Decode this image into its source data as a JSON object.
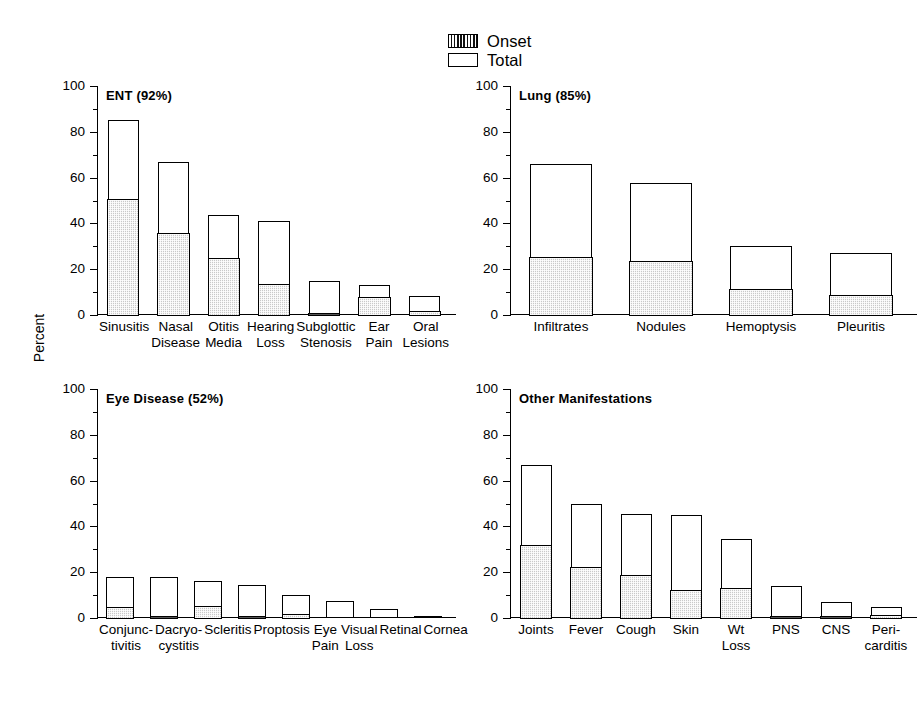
{
  "legend": {
    "items": [
      {
        "label": "Onset",
        "swatch": "hatched-dark-swatch"
      },
      {
        "label": "Total",
        "swatch": "open-white-swatch"
      }
    ]
  },
  "axis": {
    "ylabel": "Percent",
    "ticks": [
      "0",
      "20",
      "40",
      "60",
      "80",
      "100"
    ]
  },
  "colors": {
    "onset_fill": "#c9c9c9",
    "total_fill": "#ffffff",
    "outline": "#000000",
    "background": "#ffffff"
  },
  "chart_data": [
    {
      "type": "bar",
      "title": "ENT (92%)",
      "xlabel": "",
      "ylabel": "Percent",
      "ylim": [
        0,
        100
      ],
      "yticks": [
        0,
        20,
        40,
        60,
        80,
        100
      ],
      "grid": false,
      "legend_position": "top-center",
      "categories": [
        "Sinusitis",
        "Nasal\nDisease",
        "Otitis\nMedia",
        "Hearing\nLoss",
        "Subglottic\nStenosis",
        "Ear\nPain",
        "Oral\nLesions"
      ],
      "series": [
        {
          "name": "Onset",
          "values": [
            51,
            36,
            25,
            14,
            0.5,
            8,
            2
          ]
        },
        {
          "name": "Total",
          "values": [
            85,
            67,
            43.5,
            41,
            15,
            13,
            8.5
          ]
        }
      ]
    },
    {
      "type": "bar",
      "title": "Lung (85%)",
      "xlabel": "",
      "ylabel": "Percent",
      "ylim": [
        0,
        100
      ],
      "yticks": [
        0,
        20,
        40,
        60,
        80,
        100
      ],
      "grid": false,
      "categories": [
        "Infiltrates",
        "Nodules",
        "Hemoptysis",
        "Pleuritis"
      ],
      "series": [
        {
          "name": "Onset",
          "values": [
            25.5,
            24,
            11.5,
            9
          ]
        },
        {
          "name": "Total",
          "values": [
            66,
            57.5,
            30,
            27
          ]
        }
      ]
    },
    {
      "type": "bar",
      "title": "Eye Disease (52%)",
      "xlabel": "",
      "ylabel": "Percent",
      "ylim": [
        0,
        100
      ],
      "yticks": [
        0,
        20,
        40,
        60,
        80,
        100
      ],
      "grid": false,
      "categories": [
        "Conjunc-\ntivitis",
        "Dacryo-\ncystitis",
        "Scleritis",
        "Proptosis",
        "Eye\nPain",
        "Visual\nLoss",
        "Retinal",
        "Cornea"
      ],
      "series": [
        {
          "name": "Onset",
          "values": [
            5,
            0.7,
            5.5,
            1.2,
            2.2,
            0,
            0,
            0
          ]
        },
        {
          "name": "Total",
          "values": [
            18,
            17.8,
            16,
            14.5,
            10,
            7.5,
            4,
            1
          ]
        }
      ]
    },
    {
      "type": "bar",
      "title": "Other Manifestations",
      "xlabel": "",
      "ylabel": "Percent",
      "ylim": [
        0,
        100
      ],
      "yticks": [
        0,
        20,
        40,
        60,
        80,
        100
      ],
      "grid": false,
      "categories": [
        "Joints",
        "Fever",
        "Cough",
        "Skin",
        "Wt Loss",
        "PNS",
        "CNS",
        "Peri-\ncarditis"
      ],
      "series": [
        {
          "name": "Onset",
          "values": [
            32,
            22.5,
            19,
            12.5,
            13.5,
            0.5,
            0.5,
            1.5
          ]
        },
        {
          "name": "Total",
          "values": [
            67,
            50,
            45.5,
            45,
            34.5,
            14,
            7,
            5
          ]
        }
      ]
    }
  ]
}
